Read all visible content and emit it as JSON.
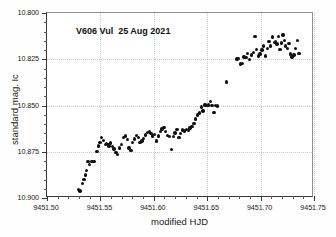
{
  "chart_data": {
    "type": "scatter",
    "title": "V606 Vul  25 Aug 2021",
    "xlabel": "modified HJD",
    "ylabel": "standard mag. Ic",
    "xlim": [
      9451.5,
      9451.75
    ],
    "ylim": [
      10.9,
      10.8
    ],
    "y_inverted": true,
    "grid": true,
    "legend": null,
    "xticks": [
      "9451.50",
      "9451.55",
      "9451.60",
      "9451.65",
      "9451.70",
      "9451.75"
    ],
    "xtick_values": [
      9451.5,
      9451.55,
      9451.6,
      9451.65,
      9451.7,
      9451.75
    ],
    "yticks": [
      "10.800",
      "10.825",
      "10.850",
      "10.875",
      "10.900"
    ],
    "ytick_values": [
      10.8,
      10.825,
      10.85,
      10.875,
      10.9
    ],
    "x_minor_step": 0.01,
    "y_minor_step": 0.005,
    "series": [
      {
        "name": "V606 Vul light curve",
        "marker": "filled-circle",
        "color": "#111111",
        "points": [
          [
            9451.5295,
            10.8955
          ],
          [
            9451.5308,
            10.8962
          ],
          [
            9451.533,
            10.8922
          ],
          [
            9451.5345,
            10.89
          ],
          [
            9451.536,
            10.8875
          ],
          [
            9451.5372,
            10.885
          ],
          [
            9451.5385,
            10.8803
          ],
          [
            9451.54,
            10.8818
          ],
          [
            9451.542,
            10.8803
          ],
          [
            9451.544,
            10.8802
          ],
          [
            9451.5468,
            10.875
          ],
          [
            9451.548,
            10.8718
          ],
          [
            9451.5495,
            10.87
          ],
          [
            9451.551,
            10.8672
          ],
          [
            9451.5528,
            10.869
          ],
          [
            9451.5545,
            10.8712
          ],
          [
            9451.5558,
            10.8705
          ],
          [
            9451.557,
            10.8712
          ],
          [
            9451.5582,
            10.8718
          ],
          [
            9451.5595,
            10.8702
          ],
          [
            9451.5612,
            10.872
          ],
          [
            9451.5628,
            10.8736
          ],
          [
            9451.5645,
            10.8755
          ],
          [
            9451.5662,
            10.8765
          ],
          [
            9451.568,
            10.873
          ],
          [
            9451.57,
            10.8712
          ],
          [
            9451.5718,
            10.8672
          ],
          [
            9451.5735,
            10.8665
          ],
          [
            9451.5752,
            10.8685
          ],
          [
            9451.5768,
            10.873
          ],
          [
            9451.5785,
            10.8742
          ],
          [
            9451.58,
            10.87
          ],
          [
            9451.582,
            10.8682
          ],
          [
            9451.5838,
            10.8662
          ],
          [
            9451.5855,
            10.8672
          ],
          [
            9451.5872,
            10.87
          ],
          [
            9451.5888,
            10.8692
          ],
          [
            9451.5905,
            10.8678
          ],
          [
            9451.5922,
            10.866
          ],
          [
            9451.594,
            10.8645
          ],
          [
            9451.5958,
            10.864
          ],
          [
            9451.5975,
            10.8652
          ],
          [
            9451.599,
            10.8665
          ],
          [
            9451.6008,
            10.8658
          ],
          [
            9451.6025,
            10.8692
          ],
          [
            9451.6042,
            10.8665
          ],
          [
            9451.606,
            10.864
          ],
          [
            9451.6078,
            10.8628
          ],
          [
            9451.6095,
            10.862
          ],
          [
            9451.6112,
            10.8642
          ],
          [
            9451.613,
            10.8662
          ],
          [
            9451.6148,
            10.8668
          ],
          [
            9451.6165,
            10.8738
          ],
          [
            9451.6182,
            10.8668
          ],
          [
            9451.62,
            10.8648
          ],
          [
            9451.6218,
            10.863
          ],
          [
            9451.6235,
            10.8672
          ],
          [
            9451.6252,
            10.8652
          ],
          [
            9451.627,
            10.8632
          ],
          [
            9451.6288,
            10.8638
          ],
          [
            9451.6305,
            10.863
          ],
          [
            9451.6322,
            10.8635
          ],
          [
            9451.634,
            10.8622
          ],
          [
            9451.6358,
            10.8612
          ],
          [
            9451.6375,
            10.8598
          ],
          [
            9451.6392,
            10.8572
          ],
          [
            9451.641,
            10.8552
          ],
          [
            9451.6428,
            10.854
          ],
          [
            9451.6445,
            10.8508
          ],
          [
            9451.6462,
            10.853
          ],
          [
            9451.6478,
            10.8498
          ],
          [
            9451.6495,
            10.85
          ],
          [
            9451.6512,
            10.8498
          ],
          [
            9451.6528,
            10.8478
          ],
          [
            9451.6545,
            10.85
          ],
          [
            9451.6562,
            10.8538
          ],
          [
            9451.658,
            10.85
          ],
          [
            9451.6598,
            10.8502
          ],
          [
            9451.668,
            10.8372
          ],
          [
            9451.6778,
            10.8248
          ],
          [
            9451.6795,
            10.8245
          ],
          [
            9451.6812,
            10.8275
          ],
          [
            9451.6828,
            10.8272
          ],
          [
            9451.6845,
            10.8238
          ],
          [
            9451.6862,
            10.824
          ],
          [
            9451.688,
            10.8218
          ],
          [
            9451.6898,
            10.8252
          ],
          [
            9451.6915,
            10.8228
          ],
          [
            9451.6932,
            10.8212
          ],
          [
            9451.6948,
            10.8128
          ],
          [
            9451.6962,
            10.8198
          ],
          [
            9451.6978,
            10.8232
          ],
          [
            9451.6995,
            10.8222
          ],
          [
            9451.7012,
            10.82
          ],
          [
            9451.7028,
            10.8178
          ],
          [
            9451.7045,
            10.8232
          ],
          [
            9451.7062,
            10.8192
          ],
          [
            9451.7078,
            10.8155
          ],
          [
            9451.7095,
            10.8178
          ],
          [
            9451.7112,
            10.813
          ],
          [
            9451.7128,
            10.8158
          ],
          [
            9451.7142,
            10.8155
          ],
          [
            9451.7155,
            10.8168
          ],
          [
            9451.7168,
            10.8128
          ],
          [
            9451.7182,
            10.8198
          ],
          [
            9451.7195,
            10.8162
          ],
          [
            9451.7208,
            10.8118
          ],
          [
            9451.7222,
            10.815
          ],
          [
            9451.7235,
            10.8178
          ],
          [
            9451.725,
            10.8192
          ],
          [
            9451.7265,
            10.8165
          ],
          [
            9451.728,
            10.8222
          ],
          [
            9451.7295,
            10.8238
          ],
          [
            9451.7312,
            10.8228
          ],
          [
            9451.7328,
            10.8192
          ],
          [
            9451.7345,
            10.815
          ],
          [
            9451.736,
            10.8218
          ]
        ]
      }
    ]
  }
}
